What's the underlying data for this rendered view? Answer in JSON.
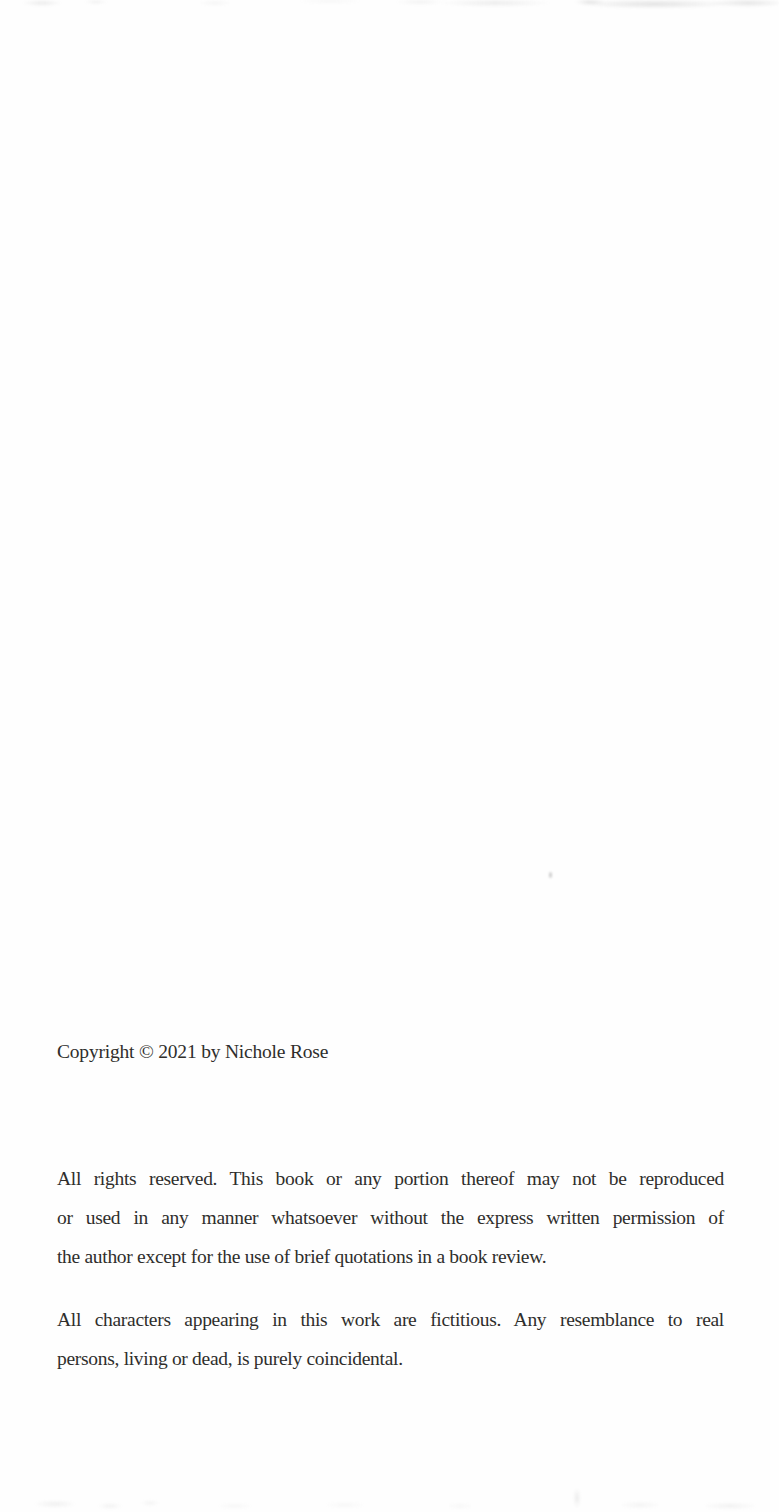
{
  "page": {
    "background_color": "#fefefe",
    "text_color": "#2f2e2c",
    "copyright_line": "Copyright © 2021 by Nichole Rose",
    "rights_paragraph": {
      "lines": [
        "All rights reserved. This book or any portion thereof may not be reproduced",
        "or used in any manner whatsoever without the express written permission of",
        "the author except for the use of brief quotations in a book review."
      ]
    },
    "disclaimer_paragraph": {
      "lines": [
        "All characters appearing in this work are fictitious. Any resemblance to real",
        "persons, living or dead, is purely coincidental."
      ]
    }
  }
}
